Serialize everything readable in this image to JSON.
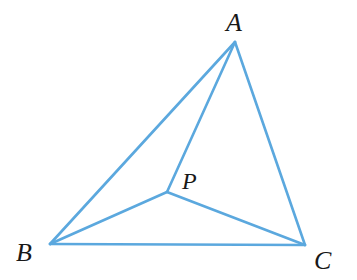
{
  "figure": {
    "kind": "geometry-diagram",
    "background_color": "#ffffff",
    "stroke_color": "#5BA8DE",
    "stroke_width": 2.6,
    "label_color": "#181818",
    "width": 357,
    "height": 280
  },
  "points": {
    "A": {
      "label": "A",
      "x": 235,
      "y": 42
    },
    "B": {
      "label": "B",
      "x": 50,
      "y": 244
    },
    "C": {
      "label": "C",
      "x": 305,
      "y": 245
    },
    "P": {
      "label": "P",
      "x": 167,
      "y": 192
    }
  },
  "segments": [
    {
      "name": "AB",
      "from": "A",
      "to": "B",
      "x1": 235,
      "y1": 42,
      "x2": 50,
      "y2": 244
    },
    {
      "name": "BC",
      "from": "B",
      "to": "C",
      "x1": 50,
      "y1": 244,
      "x2": 305,
      "y2": 245
    },
    {
      "name": "CA",
      "from": "C",
      "to": "A",
      "x1": 305,
      "y1": 245,
      "x2": 235,
      "y2": 42
    },
    {
      "name": "PA",
      "from": "P",
      "to": "A",
      "x1": 167,
      "y1": 192,
      "x2": 235,
      "y2": 42
    },
    {
      "name": "PB",
      "from": "P",
      "to": "B",
      "x1": 167,
      "y1": 192,
      "x2": 50,
      "y2": 244
    },
    {
      "name": "PC",
      "from": "P",
      "to": "C",
      "x1": 167,
      "y1": 192,
      "x2": 305,
      "y2": 245
    }
  ]
}
